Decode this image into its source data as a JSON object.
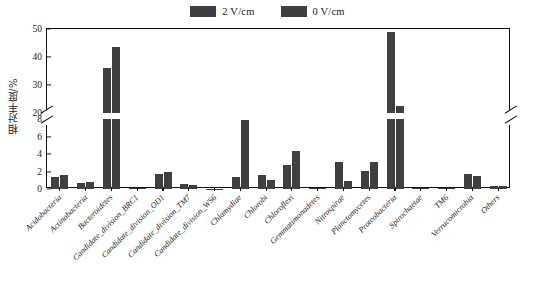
{
  "chart_data": {
    "type": "bar",
    "title": "",
    "xlabel": "",
    "ylabel": "相对丰度/%",
    "ylim": [
      0,
      50
    ],
    "y_break": {
      "lower_max": 8,
      "upper_min": 20,
      "note": "broken y axis between 8 and 20"
    },
    "yticks_lower": [
      0,
      2,
      4,
      6,
      8
    ],
    "yticks_upper": [
      20,
      30,
      40,
      50
    ],
    "grid": false,
    "legend_position": "top-center",
    "categories": [
      "Acidobacteria",
      "Actinobacteria",
      "Bacteroidetes",
      "Candidate_division_BRC1",
      "Candidate_division_OD1",
      "Candidate_division_TM7",
      "Candidate_division_WS6",
      "Chlamydiae",
      "Chlorobi",
      "Chloroflexi",
      "Gemmatimonadetes",
      "Nitrospirae",
      "Planctomycetes",
      "Proteobacteria",
      "Spirochaetae",
      "TM6",
      "Verrucomicrobia",
      "Others"
    ],
    "series": [
      {
        "name": "2 V/cm",
        "color": "#3f3f3f",
        "values": [
          1.35,
          0.65,
          36.0,
          0.1,
          1.7,
          0.6,
          0.03,
          1.35,
          1.6,
          2.7,
          0.1,
          3.1,
          2.1,
          49.0,
          0.15,
          0.08,
          1.75,
          0.4
        ]
      },
      {
        "name": "0 V/cm",
        "color": "#3f3f3f",
        "values": [
          1.6,
          0.8,
          43.5,
          0.15,
          2.0,
          0.5,
          0.03,
          7.9,
          1.05,
          4.3,
          0.12,
          0.95,
          3.1,
          22.5,
          0.15,
          0.1,
          1.5,
          0.4
        ]
      }
    ]
  },
  "legend": {
    "items": [
      {
        "label": "2 V/cm",
        "color": "#3f3f3f"
      },
      {
        "label": "0 V/cm",
        "color": "#3f3f3f"
      }
    ]
  },
  "axis": {
    "y_title": "相对丰度/%"
  }
}
